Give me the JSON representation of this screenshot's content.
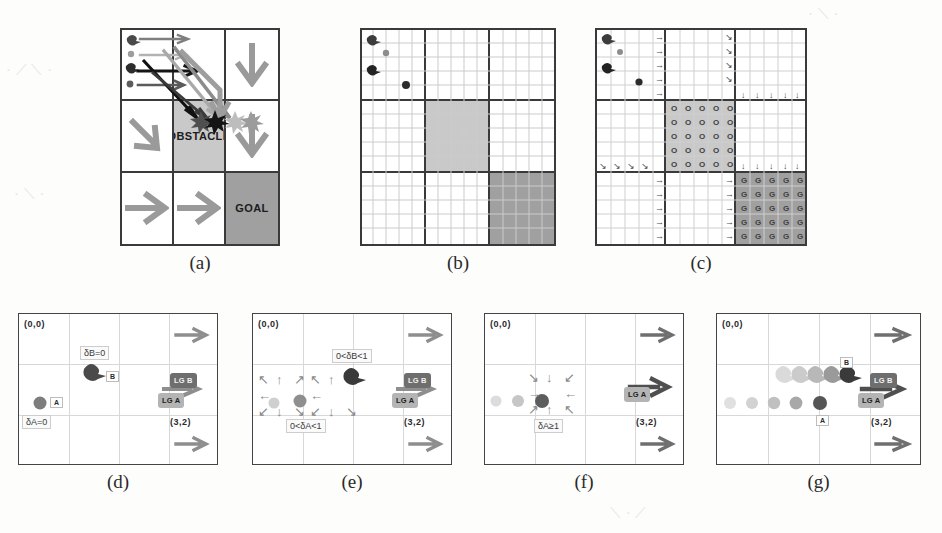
{
  "figure": {
    "panels": [
      {
        "id": "a",
        "caption": "(a)",
        "type": "coarse-grid"
      },
      {
        "id": "b",
        "caption": "(b)",
        "type": "fine-grid"
      },
      {
        "id": "c",
        "caption": "(c)",
        "type": "fine-grid-policy"
      },
      {
        "id": "d",
        "caption": "(d)",
        "type": "trajectory"
      },
      {
        "id": "e",
        "caption": "(e)",
        "type": "trajectory"
      },
      {
        "id": "f",
        "caption": "(f)",
        "type": "trajectory"
      },
      {
        "id": "g",
        "caption": "(g)",
        "type": "trajectory"
      }
    ]
  },
  "panel_a": {
    "cells": [
      {
        "row": 0,
        "col": 0,
        "label": "",
        "arrow": ""
      },
      {
        "row": 0,
        "col": 1,
        "label": "",
        "arrow": ""
      },
      {
        "row": 0,
        "col": 2,
        "label": "",
        "arrow": "↓"
      },
      {
        "row": 1,
        "col": 0,
        "label": "",
        "arrow": "↘"
      },
      {
        "row": 1,
        "col": 1,
        "label": "OBSTACLE",
        "arrow": ""
      },
      {
        "row": 1,
        "col": 2,
        "label": "",
        "arrow": "↓"
      },
      {
        "row": 2,
        "col": 0,
        "label": "",
        "arrow": "→"
      },
      {
        "row": 2,
        "col": 1,
        "label": "",
        "arrow": "→"
      },
      {
        "row": 2,
        "col": 2,
        "label": "GOAL",
        "arrow": ""
      }
    ],
    "obstacle_label": "OBSTACLE",
    "goal_label": "GOAL",
    "collision_markers": 4,
    "agent_count": 4
  },
  "panel_b": {
    "subdivision": 5,
    "agent_count": 4,
    "obstacle_cell": "center",
    "goal_cell": "bottom-right"
  },
  "panel_c": {
    "subdivision": 5,
    "obstacle_glyph": "O",
    "goal_glyph": "G",
    "arrow_right": "→",
    "arrow_down": "↓",
    "arrow_down_right": "↘",
    "agent_count": 4
  },
  "panel_d": {
    "origin_label": "(0,0)",
    "corner_label": "(3,2)",
    "delta_a": "δA=0",
    "delta_b": "δB=0",
    "agent_a_id": "A",
    "agent_b_id": "B",
    "lg_a": "LG A",
    "lg_b": "LG B",
    "arrow": "→"
  },
  "panel_e": {
    "origin_label": "(0,0)",
    "corner_label": "(3,2)",
    "delta_a": "0<δA<1",
    "delta_b": "0<δB<1",
    "lg_a": "LG A",
    "lg_b": "LG B",
    "arrow": "→",
    "arrow_cluster": [
      "↖",
      "↑",
      "↗",
      "←",
      "→",
      "↙",
      "↓",
      "↘"
    ]
  },
  "panel_f": {
    "origin_label": "(0,0)",
    "corner_label": "(3,2)",
    "delta_a": "δA≥1",
    "lg_a": "LG A",
    "arrow": "→",
    "arrow_cluster": [
      "↘",
      "↓",
      "↙",
      "→",
      "←",
      "↗",
      "↑",
      "↖"
    ]
  },
  "panel_g": {
    "origin_label": "(0,0)",
    "corner_label": "(3,2)",
    "agent_a_id": "A",
    "agent_b_id": "B",
    "lg_a": "LG A",
    "lg_b": "LG B",
    "arrow": "→",
    "trail_steps": 5
  },
  "colors": {
    "obstacle": "#c9c9c9",
    "goal": "#a0a0a0",
    "grid_line": "#3a3a3a",
    "fine_line": "#cfcfcf",
    "arrow": "#9a9a9a",
    "lg_a_bg": "#b4b4b4",
    "lg_b_bg": "#6e6e6e",
    "page_bg": "#fdfdfb"
  }
}
